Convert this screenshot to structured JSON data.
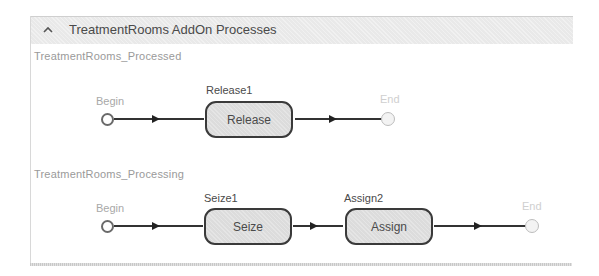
{
  "panel": {
    "title": "TreatmentRooms AddOn Processes",
    "collapse_icon": "chevron-up-icon"
  },
  "processes": [
    {
      "name": "TreatmentRooms_Processed",
      "begin_label": "Begin",
      "end_label": "End",
      "steps": [
        {
          "id": "Release1",
          "type": "Release"
        }
      ]
    },
    {
      "name": "TreatmentRooms_Processing",
      "begin_label": "Begin",
      "end_label": "End",
      "steps": [
        {
          "id": "Seize1",
          "type": "Seize"
        },
        {
          "id": "Assign2",
          "type": "Assign"
        }
      ]
    }
  ],
  "colors": {
    "header_bg": "#e9e9e9",
    "step_fill": "#dcdcdc",
    "step_border": "#3a3a3a",
    "connector": "#333333"
  }
}
